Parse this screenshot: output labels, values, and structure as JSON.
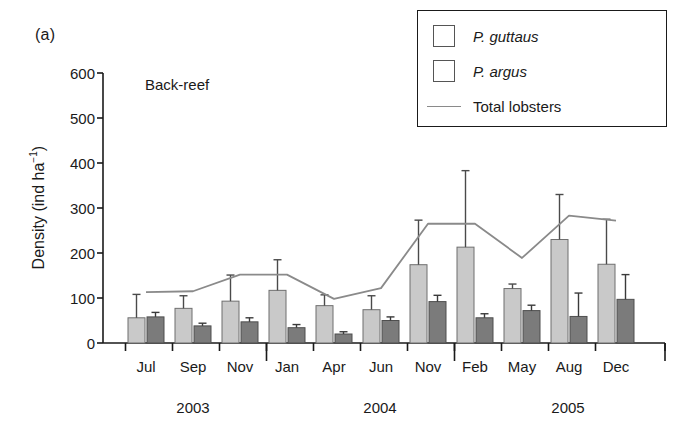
{
  "figure": {
    "panel_label": "(a)",
    "subtitle": "Back-reef"
  },
  "legend": {
    "items": [
      {
        "label": "P. guttaus",
        "marker": "light-square-swatch",
        "color": "#c9c9c9",
        "italic": true
      },
      {
        "label": "P. argus",
        "marker": "dark-square-swatch",
        "color": "#7b7b7b",
        "italic": true
      },
      {
        "label": "Total lobsters",
        "marker": "line-swatch",
        "color": "#8a8a8a",
        "italic": false
      }
    ]
  },
  "chart_data": {
    "type": "bar",
    "title": "Back-reef",
    "xlabel": "",
    "ylabel": "Density (ind ha⁻¹)",
    "ylim": [
      0,
      600
    ],
    "yticks": [
      0,
      100,
      200,
      300,
      400,
      500,
      600
    ],
    "ytick_labels": [
      "0",
      "100",
      "200",
      "300",
      "400",
      "500",
      "600"
    ],
    "grid": false,
    "legend_position": "top-right",
    "categories": [
      "Jul",
      "Sep",
      "Nov",
      "Jan",
      "Apr",
      "Jun",
      "Nov",
      "Feb",
      "May",
      "Aug",
      "Dec"
    ],
    "year_groups": [
      {
        "label": "2003",
        "start_index": 0,
        "end_index": 2
      },
      {
        "label": "2004",
        "start_index": 3,
        "end_index": 6
      },
      {
        "label": "2005",
        "start_index": 7,
        "end_index": 10
      }
    ],
    "series": [
      {
        "name": "P. guttaus",
        "type": "bar",
        "color": "#c9c9c9",
        "values": [
          56,
          77,
          93,
          117,
          83,
          74,
          174,
          213,
          121,
          230,
          175
        ],
        "errors": [
          52,
          28,
          58,
          68,
          24,
          31,
          99,
          170,
          10,
          100,
          100
        ]
      },
      {
        "name": "P. argus",
        "type": "bar",
        "color": "#7b7b7b",
        "values": [
          58,
          38,
          47,
          34,
          20,
          50,
          92,
          56,
          72,
          59,
          97
        ]
      },
      {
        "name": "P. argus error",
        "type": "error",
        "values": [
          10,
          6,
          9,
          7,
          5,
          8,
          14,
          9,
          12,
          52,
          55
        ]
      },
      {
        "name": "Total lobsters",
        "type": "line",
        "color": "#8a8a8a",
        "values": [
          113,
          115,
          152,
          152,
          98,
          122,
          265,
          265,
          189,
          283,
          272
        ]
      }
    ]
  },
  "axis": {
    "tick_color": "#1a1a1a"
  }
}
